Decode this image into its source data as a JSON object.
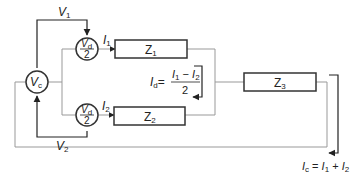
{
  "diagram": {
    "type": "circuit-block-diagram",
    "sources": {
      "vc": {
        "label": "V",
        "sub": "c"
      },
      "vd_top": {
        "num": "V",
        "num_sub": "d",
        "den": "2"
      },
      "vd_bottom": {
        "num": "V",
        "num_sub": "d",
        "den": "2"
      }
    },
    "voltages": {
      "v1": {
        "label": "V",
        "sub": "1"
      },
      "v2": {
        "label": "V",
        "sub": "2"
      }
    },
    "currents": {
      "i1": {
        "label": "I",
        "sub": "1"
      },
      "i2": {
        "label": "I",
        "sub": "2"
      }
    },
    "impedances": {
      "z1": {
        "label": "Z",
        "sub": "1"
      },
      "z2": {
        "label": "Z",
        "sub": "2"
      },
      "z3": {
        "label": "Z",
        "sub": "3"
      }
    },
    "equations": {
      "id": {
        "lhs": "I",
        "lhs_sub": "d",
        "eq": "=",
        "num_a": "I",
        "num_a_sub": "1",
        "minus": " − ",
        "num_b": "I",
        "num_b_sub": "2",
        "den": "2"
      },
      "ic": {
        "lhs": "I",
        "lhs_sub": "c",
        "eq": " = ",
        "a": "I",
        "a_sub": "1",
        "plus": " + ",
        "b": "I",
        "b_sub": "2"
      }
    }
  }
}
